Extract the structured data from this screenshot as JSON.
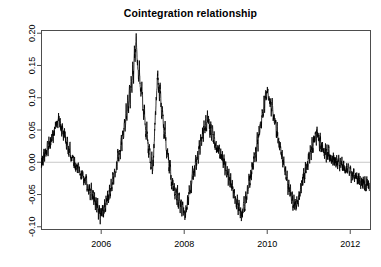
{
  "chart_data": {
    "type": "line",
    "title": "Cointegration relationship",
    "xlabel": "",
    "ylabel": "",
    "xlim": [
      2004.55,
      2012.5
    ],
    "ylim": [
      -0.105,
      0.205
    ],
    "grid": false,
    "legend": null,
    "zero_line": 0.0,
    "zero_line_color": "#c8c8c8",
    "line_color": "#000000",
    "line_width": 0.8,
    "box_color": "#4d4d4d",
    "xticks": [
      2006,
      2008,
      2010,
      2012
    ],
    "xtick_labels": [
      "2006",
      "2008",
      "2010",
      "2012"
    ],
    "yticks": [
      -0.1,
      -0.05,
      0.0,
      0.05,
      0.1,
      0.15,
      0.2
    ],
    "ytick_labels": [
      "-0.10",
      "-0.05",
      "0.00",
      "0.05",
      "0.10",
      "0.15",
      "0.20"
    ],
    "series": [
      {
        "name": "cointegration residual",
        "x": [
          2004.56,
          2004.58,
          2004.6,
          2004.62,
          2004.64,
          2004.66,
          2004.68,
          2004.7,
          2004.72,
          2004.74,
          2004.76,
          2004.78,
          2004.8,
          2004.82,
          2004.84,
          2004.86,
          2004.88,
          2004.9,
          2004.92,
          2004.94,
          2004.96,
          2004.98,
          2005.0,
          2005.02,
          2005.04,
          2005.06,
          2005.08,
          2005.1,
          2005.12,
          2005.14,
          2005.16,
          2005.18,
          2005.2,
          2005.22,
          2005.24,
          2005.26,
          2005.28,
          2005.3,
          2005.32,
          2005.34,
          2005.36,
          2005.38,
          2005.4,
          2005.42,
          2005.44,
          2005.46,
          2005.48,
          2005.5,
          2005.52,
          2005.54,
          2005.56,
          2005.58,
          2005.6,
          2005.62,
          2005.64,
          2005.66,
          2005.68,
          2005.7,
          2005.72,
          2005.74,
          2005.76,
          2005.78,
          2005.8,
          2005.82,
          2005.84,
          2005.86,
          2005.88,
          2005.9,
          2005.92,
          2005.94,
          2005.96,
          2005.98,
          2006.0,
          2006.02,
          2006.04,
          2006.06,
          2006.08,
          2006.1,
          2006.12,
          2006.14,
          2006.16,
          2006.18,
          2006.2,
          2006.22,
          2006.24,
          2006.26,
          2006.28,
          2006.3,
          2006.32,
          2006.34,
          2006.36,
          2006.38,
          2006.4,
          2006.42,
          2006.44,
          2006.46,
          2006.48,
          2006.5,
          2006.52,
          2006.54,
          2006.56,
          2006.58,
          2006.6,
          2006.62,
          2006.64,
          2006.66,
          2006.68,
          2006.7,
          2006.72,
          2006.74,
          2006.76,
          2006.78,
          2006.8,
          2006.82,
          2006.84,
          2006.86,
          2006.88,
          2006.9,
          2006.92,
          2006.94,
          2006.96,
          2006.98,
          2007.0,
          2007.02,
          2007.04,
          2007.06,
          2007.08,
          2007.1,
          2007.12,
          2007.14,
          2007.16,
          2007.18,
          2007.2,
          2007.22,
          2007.24,
          2007.26,
          2007.28,
          2007.3,
          2007.32,
          2007.34,
          2007.36,
          2007.38,
          2007.4,
          2007.42,
          2007.44,
          2007.46,
          2007.48,
          2007.5,
          2007.52,
          2007.54,
          2007.56,
          2007.58,
          2007.6,
          2007.62,
          2007.64,
          2007.66,
          2007.68,
          2007.7,
          2007.72,
          2007.74,
          2007.76,
          2007.78,
          2007.8,
          2007.82,
          2007.84,
          2007.86,
          2007.88,
          2007.9,
          2007.92,
          2007.94,
          2007.96,
          2007.98,
          2008.0,
          2008.02,
          2008.04,
          2008.06,
          2008.08,
          2008.1,
          2008.12,
          2008.14,
          2008.16,
          2008.18,
          2008.2,
          2008.22,
          2008.24,
          2008.26,
          2008.28,
          2008.3,
          2008.32,
          2008.34,
          2008.36,
          2008.38,
          2008.4,
          2008.42,
          2008.44,
          2008.46,
          2008.48,
          2008.5,
          2008.52,
          2008.54,
          2008.56,
          2008.58,
          2008.6,
          2008.62,
          2008.64,
          2008.66,
          2008.68,
          2008.7,
          2008.72,
          2008.74,
          2008.76,
          2008.78,
          2008.8,
          2008.82,
          2008.84,
          2008.86,
          2008.88,
          2008.9,
          2008.92,
          2008.94,
          2008.96,
          2008.98,
          2009.0,
          2009.02,
          2009.04,
          2009.06,
          2009.08,
          2009.1,
          2009.12,
          2009.14,
          2009.16,
          2009.18,
          2009.2,
          2009.22,
          2009.24,
          2009.26,
          2009.28,
          2009.3,
          2009.32,
          2009.34,
          2009.36,
          2009.38,
          2009.4,
          2009.42,
          2009.44,
          2009.46,
          2009.48,
          2009.5,
          2009.52,
          2009.54,
          2009.56,
          2009.58,
          2009.6,
          2009.62,
          2009.64,
          2009.66,
          2009.68,
          2009.7,
          2009.72,
          2009.74,
          2009.76,
          2009.78,
          2009.8,
          2009.82,
          2009.84,
          2009.86,
          2009.88,
          2009.9,
          2009.92,
          2009.94,
          2009.96,
          2009.98,
          2010.0,
          2010.02,
          2010.04,
          2010.06,
          2010.08,
          2010.1,
          2010.12,
          2010.14,
          2010.16,
          2010.18,
          2010.2,
          2010.22,
          2010.24,
          2010.26,
          2010.28,
          2010.3,
          2010.32,
          2010.34,
          2010.36,
          2010.38,
          2010.4,
          2010.42,
          2010.44,
          2010.46,
          2010.48,
          2010.5,
          2010.52,
          2010.54,
          2010.56,
          2010.58,
          2010.6,
          2010.62,
          2010.64,
          2010.66,
          2010.68,
          2010.7,
          2010.72,
          2010.74,
          2010.76,
          2010.78,
          2010.8,
          2010.82,
          2010.84,
          2010.86,
          2010.88,
          2010.9,
          2010.92,
          2010.94,
          2010.96,
          2010.98,
          2011.0,
          2011.02,
          2011.04,
          2011.06,
          2011.08,
          2011.1,
          2011.12,
          2011.14,
          2011.16,
          2011.18,
          2011.2,
          2011.22,
          2011.24,
          2011.26,
          2011.28,
          2011.3,
          2011.32,
          2011.34,
          2011.36,
          2011.38,
          2011.4,
          2011.42,
          2011.44,
          2011.46,
          2011.48,
          2011.5,
          2011.52,
          2011.54,
          2011.56,
          2011.58,
          2011.6,
          2011.62,
          2011.64,
          2011.66,
          2011.68,
          2011.7,
          2011.72,
          2011.74,
          2011.76,
          2011.78,
          2011.8,
          2011.82,
          2011.84,
          2011.86,
          2011.88,
          2011.9,
          2011.92,
          2011.94,
          2011.96,
          2011.98,
          2012.0,
          2012.02,
          2012.04,
          2012.06,
          2012.08,
          2012.1,
          2012.12,
          2012.14,
          2012.16,
          2012.18,
          2012.2,
          2012.22,
          2012.24,
          2012.26,
          2012.28,
          2012.3,
          2012.32,
          2012.34,
          2012.36,
          2012.38,
          2012.4,
          2012.42,
          2012.44,
          2012.46
        ],
        "values": [
          -0.002,
          0.005,
          -0.004,
          0.012,
          0.004,
          0.018,
          0.01,
          0.022,
          0.014,
          0.028,
          0.02,
          0.034,
          0.026,
          0.042,
          0.033,
          0.05,
          0.042,
          0.058,
          0.05,
          0.066,
          0.056,
          0.07,
          0.062,
          0.055,
          0.048,
          0.056,
          0.046,
          0.038,
          0.046,
          0.036,
          0.028,
          0.035,
          0.025,
          0.018,
          0.026,
          0.014,
          0.006,
          0.014,
          0.002,
          -0.006,
          0.002,
          -0.01,
          -0.002,
          -0.014,
          -0.006,
          -0.018,
          -0.01,
          -0.022,
          -0.014,
          -0.026,
          -0.018,
          -0.03,
          -0.022,
          -0.034,
          -0.026,
          -0.04,
          -0.03,
          -0.044,
          -0.036,
          -0.05,
          -0.04,
          -0.056,
          -0.046,
          -0.062,
          -0.052,
          -0.07,
          -0.058,
          -0.078,
          -0.064,
          -0.086,
          -0.072,
          -0.09,
          -0.078,
          -0.086,
          -0.07,
          -0.082,
          -0.062,
          -0.076,
          -0.056,
          -0.068,
          -0.048,
          -0.06,
          -0.04,
          -0.052,
          -0.03,
          -0.044,
          -0.02,
          -0.034,
          -0.01,
          -0.024,
          0.0,
          -0.014,
          0.012,
          -0.002,
          0.026,
          0.01,
          0.04,
          0.022,
          0.054,
          0.034,
          0.068,
          0.048,
          0.084,
          0.062,
          0.1,
          0.078,
          0.118,
          0.094,
          0.136,
          0.11,
          0.156,
          0.128,
          0.176,
          0.148,
          0.196,
          0.17,
          0.15,
          0.13,
          0.148,
          0.118,
          0.1,
          0.12,
          0.088,
          0.068,
          0.088,
          0.058,
          0.04,
          0.058,
          0.03,
          0.012,
          0.032,
          0.004,
          -0.012,
          0.008,
          -0.02,
          0.005,
          0.038,
          0.062,
          0.09,
          0.118,
          0.14,
          0.12,
          0.098,
          0.116,
          0.09,
          0.068,
          0.086,
          0.058,
          0.038,
          0.056,
          0.03,
          0.012,
          0.03,
          0.004,
          -0.014,
          0.004,
          -0.024,
          -0.04,
          -0.022,
          -0.05,
          -0.034,
          -0.058,
          -0.04,
          -0.064,
          -0.046,
          -0.07,
          -0.052,
          -0.076,
          -0.058,
          -0.08,
          -0.062,
          -0.084,
          -0.066,
          -0.086,
          -0.068,
          -0.076,
          -0.056,
          -0.064,
          -0.044,
          -0.052,
          -0.03,
          -0.04,
          -0.018,
          -0.028,
          -0.006,
          -0.016,
          0.006,
          -0.004,
          0.018,
          0.008,
          0.03,
          0.02,
          0.042,
          0.032,
          0.052,
          0.04,
          0.06,
          0.046,
          0.066,
          0.052,
          0.07,
          0.056,
          0.064,
          0.048,
          0.058,
          0.04,
          0.05,
          0.034,
          0.042,
          0.026,
          0.036,
          0.02,
          0.03,
          0.014,
          0.024,
          0.008,
          0.018,
          0.002,
          0.012,
          -0.006,
          0.004,
          -0.014,
          -0.002,
          -0.022,
          -0.01,
          -0.03,
          -0.018,
          -0.038,
          -0.026,
          -0.046,
          -0.034,
          -0.054,
          -0.042,
          -0.062,
          -0.05,
          -0.07,
          -0.058,
          -0.078,
          -0.064,
          -0.086,
          -0.07,
          -0.092,
          -0.074,
          -0.082,
          -0.06,
          -0.07,
          -0.048,
          -0.058,
          -0.036,
          -0.046,
          -0.024,
          -0.034,
          -0.012,
          -0.022,
          0.0,
          -0.01,
          0.014,
          0.002,
          0.028,
          0.014,
          0.042,
          0.026,
          0.056,
          0.04,
          0.07,
          0.054,
          0.084,
          0.068,
          0.098,
          0.082,
          0.11,
          0.094,
          0.12,
          0.102,
          0.11,
          0.09,
          0.1,
          0.078,
          0.088,
          0.066,
          0.076,
          0.054,
          0.064,
          0.042,
          0.052,
          0.03,
          0.04,
          0.018,
          0.028,
          0.006,
          0.016,
          -0.006,
          0.004,
          -0.018,
          -0.008,
          -0.03,
          -0.02,
          -0.042,
          -0.03,
          -0.052,
          -0.04,
          -0.06,
          -0.048,
          -0.066,
          -0.054,
          -0.07,
          -0.058,
          -0.074,
          -0.06,
          -0.07,
          -0.05,
          -0.058,
          -0.038,
          -0.046,
          -0.026,
          -0.034,
          -0.016,
          -0.024,
          -0.006,
          -0.014,
          0.004,
          -0.004,
          0.014,
          0.004,
          0.024,
          0.012,
          0.032,
          0.018,
          0.04,
          0.026,
          0.046,
          0.032,
          0.05,
          0.036,
          0.046,
          0.03,
          0.04,
          0.022,
          0.032,
          0.016,
          0.026,
          0.012,
          0.022,
          0.008,
          0.018,
          0.006,
          0.016,
          0.004,
          0.014,
          0.002,
          0.012,
          0.0,
          0.01,
          -0.002,
          0.008,
          -0.004,
          0.006,
          -0.006,
          0.004,
          -0.008,
          0.002,
          -0.01,
          0.0,
          -0.012,
          -0.002,
          -0.014,
          -0.004,
          -0.016,
          -0.006,
          -0.018,
          -0.008,
          -0.02,
          -0.01,
          -0.022,
          -0.012,
          -0.024,
          -0.014,
          -0.026,
          -0.016,
          -0.028,
          -0.018,
          -0.03,
          -0.02,
          -0.032,
          -0.022,
          -0.034,
          -0.024,
          -0.036,
          -0.026,
          -0.038,
          -0.028,
          -0.04,
          -0.03,
          -0.042,
          -0.032,
          -0.044
        ]
      }
    ]
  },
  "axes": {
    "plot_box": {
      "left": 41,
      "top": 30,
      "right": 371,
      "bottom": 230
    }
  }
}
